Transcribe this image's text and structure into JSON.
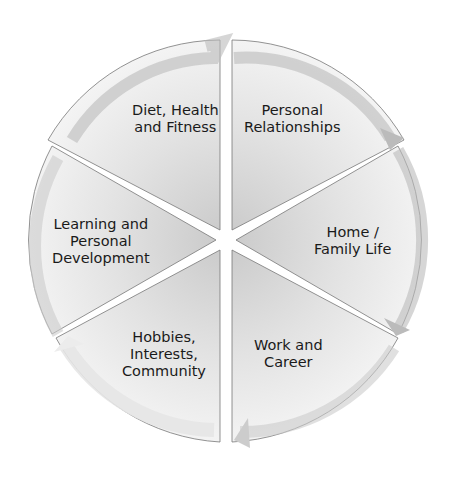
{
  "diagram": {
    "type": "cycle-wheel",
    "segments": [
      {
        "id": "diet",
        "line1": "Diet, Health",
        "line2": "and Fitness",
        "line3": ""
      },
      {
        "id": "relationships",
        "line1": "Personal",
        "line2": "Relationships",
        "line3": ""
      },
      {
        "id": "home",
        "line1": "Home /",
        "line2": "Family Life",
        "line3": ""
      },
      {
        "id": "work",
        "line1": "Work and",
        "line2": "Career",
        "line3": ""
      },
      {
        "id": "hobbies",
        "line1": "Hobbies,",
        "line2": "Interests,",
        "line3": "Community"
      },
      {
        "id": "learning",
        "line1": "Learning and",
        "line2": "Personal",
        "line3": "Development"
      }
    ],
    "colors": {
      "segment_light": "#f0f0f0",
      "segment_dark": "#cfcfcf",
      "arrow": "#d8d8d8",
      "edge": "#6a6a6a",
      "text": "#1a1a1a"
    }
  }
}
